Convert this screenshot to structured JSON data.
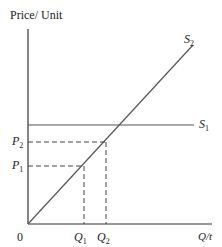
{
  "diagram": {
    "y_axis_label": "Price/ Unit",
    "x_axis_label": "Q/t",
    "origin_label": "0",
    "curves": [
      {
        "name": "S",
        "sub": "2",
        "type": "upward-sloping supply"
      },
      {
        "name": "S",
        "sub": "1",
        "type": "horizontal supply"
      }
    ],
    "price_marks": [
      {
        "name": "P",
        "sub": "2"
      },
      {
        "name": "P",
        "sub": "1"
      }
    ],
    "quantity_marks": [
      {
        "name": "Q",
        "sub": "1"
      },
      {
        "name": "Q",
        "sub": "2"
      }
    ],
    "colors": {
      "axis": "#333333",
      "curve": "#555555",
      "dashed": "#444444"
    }
  }
}
